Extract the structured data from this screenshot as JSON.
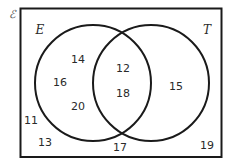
{
  "diagram": {
    "type": "venn",
    "universal_symbol": "ℰ",
    "sets": [
      {
        "name": "E",
        "label": "E"
      },
      {
        "name": "T",
        "label": "T"
      }
    ],
    "regions": {
      "E_only": [
        "14",
        "16",
        "20"
      ],
      "E_and_T": [
        "12",
        "18"
      ],
      "T_only": [
        "15"
      ],
      "outside": [
        "11",
        "13",
        "17",
        "19"
      ]
    },
    "colors": {
      "stroke": "#1a1a1a",
      "text": "#2a2a2a",
      "background": "#ffffff"
    }
  }
}
